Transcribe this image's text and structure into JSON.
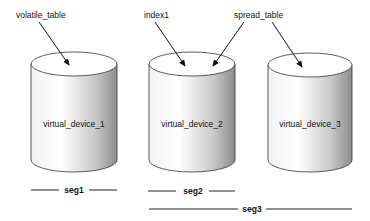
{
  "diagram": {
    "labels": {
      "volatile_table": "volatile_table",
      "index1": "index1",
      "spread_table": "spread_table"
    },
    "devices": [
      {
        "label": "virtual_device_1"
      },
      {
        "label": "virtual_device_2"
      },
      {
        "label": "virtual_device_3"
      }
    ],
    "segments": [
      {
        "label": "seg1"
      },
      {
        "label": "seg2"
      },
      {
        "label": "seg3"
      }
    ]
  }
}
